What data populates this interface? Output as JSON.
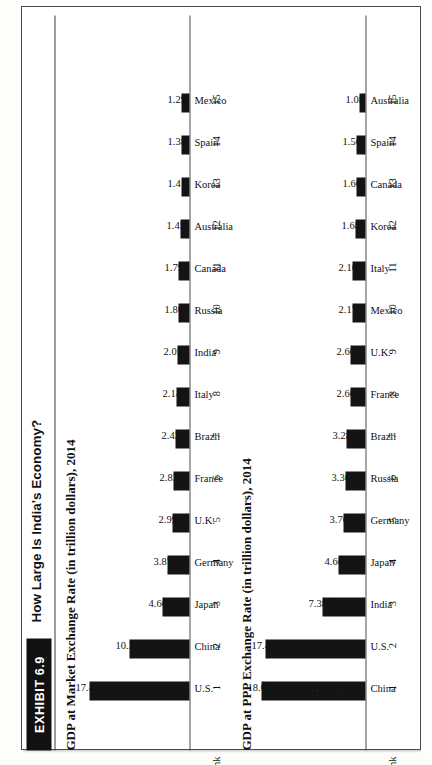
{
  "exhibit": {
    "badge_label": "EXHIBIT 6.9",
    "title": "How Large Is India's Economy?",
    "rank_header": "Rank"
  },
  "chart_data": [
    {
      "type": "bar",
      "id": "market-exchange-rate",
      "title": "GDP at Market Exchange Rate (in trillion dollars), 2014",
      "xlabel": "",
      "ylabel": "GDP (trillion dollars)",
      "ylim": [
        0,
        18.5
      ],
      "grid": false,
      "legend": "none",
      "orientation": "vertical",
      "ranks": [
        "1",
        "2",
        "3",
        "4",
        "5",
        "6",
        "7",
        "8",
        "9",
        "10",
        "11",
        "12",
        "13",
        "14",
        "15"
      ],
      "categories": [
        "U.S.",
        "China",
        "Japan",
        "Germany",
        "U.K.",
        "France",
        "Brazil",
        "Italy",
        "India",
        "Russia",
        "Canada",
        "Australia",
        "Korea",
        "Spain",
        "Mexico"
      ],
      "values": [
        17.42,
        10.35,
        4.6,
        3.87,
        2.99,
        2.83,
        2.42,
        2.14,
        2.05,
        1.86,
        1.79,
        1.45,
        1.41,
        1.38,
        1.29
      ],
      "value_labels": [
        "17.42",
        "10.35",
        "4.60",
        "3.87",
        "2.99",
        "2.83",
        "2.42",
        "2.14",
        "2.05",
        "1.86",
        "1.79",
        "1.45",
        "1.41",
        "1.38",
        "1.29"
      ]
    },
    {
      "type": "bar",
      "id": "ppp-exchange-rate",
      "title": "GDP at PPP Exchange Rate (in trillion dollars), 2014",
      "xlabel": "",
      "ylabel": "GDP (trillion dollars)",
      "ylim": [
        0,
        18.5
      ],
      "grid": false,
      "legend": "none",
      "orientation": "vertical",
      "ranks": [
        "1",
        "2",
        "3",
        "4",
        "5",
        "6",
        "7",
        "8",
        "9",
        "10",
        "11",
        "12",
        "13",
        "14",
        "15"
      ],
      "categories": [
        "China",
        "U.S.",
        "India",
        "Japan",
        "Germany",
        "Russia",
        "Brazil",
        "France",
        "U.K.",
        "Mexico",
        "Italy",
        "Korea",
        "Canada",
        "Spain",
        "Australia"
      ],
      "values": [
        18.02,
        17.42,
        7.38,
        4.66,
        3.76,
        3.36,
        3.28,
        2.6,
        2.6,
        2.17,
        2.16,
        1.68,
        1.6,
        1.56,
        1.08
      ],
      "value_labels": [
        "18.02",
        "17.42",
        "7.38",
        "4.66",
        "3.76",
        "3.36",
        "3.28",
        "2.60",
        "2.60",
        "2.17",
        "2.16",
        "1.68",
        "1.60",
        "1.56",
        "1.08"
      ]
    }
  ],
  "colors": {
    "bar": "#141414",
    "badge_bg": "#111111",
    "badge_text": "#ffffff",
    "axis": "#4c4c4c",
    "page": "#ffffff"
  }
}
